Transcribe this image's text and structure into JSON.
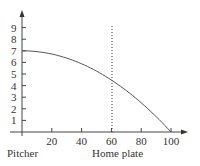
{
  "chart_data": {
    "type": "line",
    "title": "",
    "xlabel": "",
    "ylabel": "",
    "x_ticks": [
      20,
      40,
      60,
      80,
      100
    ],
    "y_ticks": [
      1,
      2,
      3,
      4,
      5,
      6,
      7,
      8,
      9
    ],
    "xlim": [
      0,
      105
    ],
    "ylim": [
      0,
      10
    ],
    "grid": false,
    "series": [
      {
        "name": "trajectory",
        "x": [
          0,
          20,
          40,
          60,
          80,
          100
        ],
        "y": [
          7.0,
          6.7,
          5.8,
          4.4,
          2.5,
          0.0
        ]
      }
    ],
    "annotations": [
      {
        "type": "vline",
        "x": 60,
        "style": "dotted"
      },
      {
        "text": "Pitcher",
        "at_x": 0
      },
      {
        "text": "Home plate",
        "at_x": 60
      }
    ]
  },
  "labels": {
    "pitcher": "Pitcher",
    "home_plate": "Home plate",
    "x_ticks": [
      "20",
      "40",
      "60",
      "80",
      "100"
    ],
    "y_ticks": [
      "1",
      "2",
      "3",
      "4",
      "5",
      "6",
      "7",
      "8",
      "9"
    ]
  }
}
